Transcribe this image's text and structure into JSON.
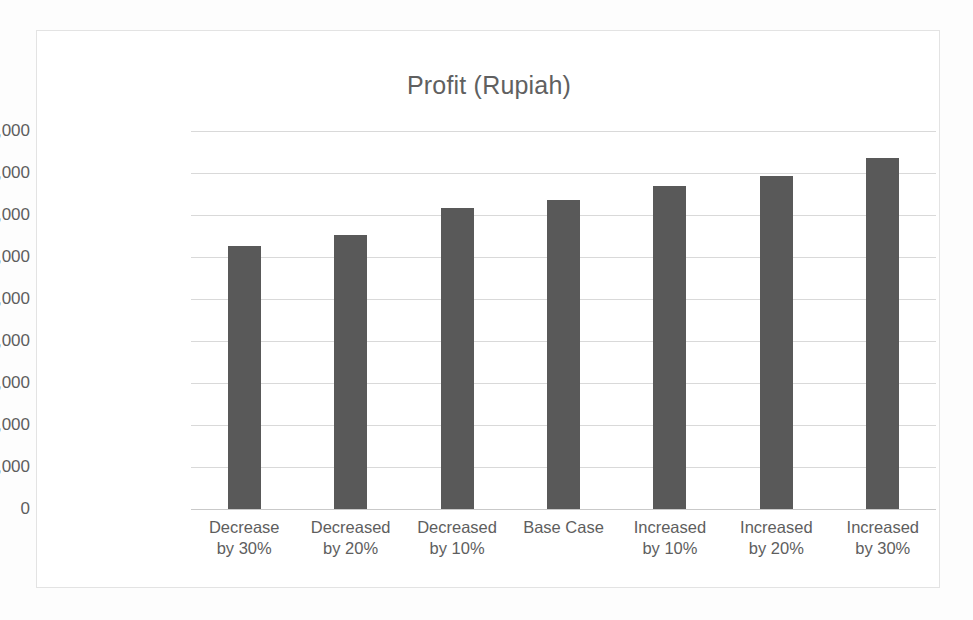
{
  "chart_data": {
    "type": "bar",
    "title": "Profit (Rupiah)",
    "xlabel": "",
    "ylabel": "",
    "categories": [
      "Decrease\nby 30%",
      "Decreased\nby 20%",
      "Decreased\nby 10%",
      "Base Case",
      "Increased\nby 10%",
      "Increased\nby 20%",
      "Increased\nby 30%"
    ],
    "values": [
      3130000000,
      3260000000,
      3580000000,
      3680000000,
      3850000000,
      3970000000,
      4180000000
    ],
    "ylim": [
      0,
      4500000000
    ],
    "ytick_values": [
      0,
      500000000,
      1000000000,
      1500000000,
      2000000000,
      2500000000,
      3000000000,
      3500000000,
      4000000000,
      4500000000
    ],
    "ytick_labels": [
      "0",
      "500,000,000",
      "1,000,000,000",
      "1,500,000,000",
      "2,000,000,000",
      "2,500,000,000",
      "3,000,000,000",
      "3,500,000,000",
      "4,000,000,000",
      "4,500,000,000"
    ],
    "grid": true,
    "legend": false,
    "legend_position": "none",
    "series_color": "#595959",
    "gridline_color": "#d9d9d9",
    "text_color": "#5e5e5e"
  }
}
